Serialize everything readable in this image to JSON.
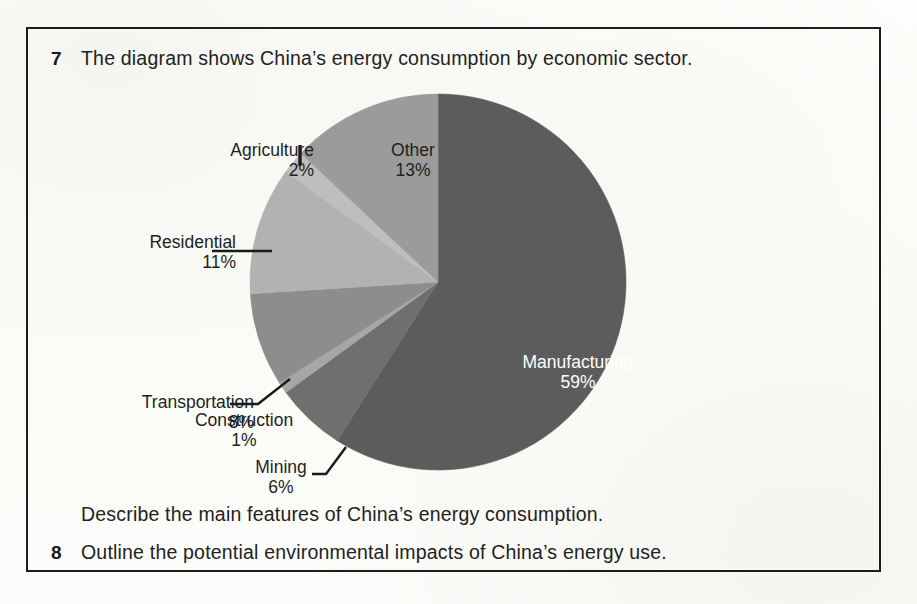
{
  "exercise": {
    "question_7": {
      "number": "7",
      "prompt": "The diagram shows China’s energy consumption by economic sector.",
      "sub_prompt": "Describe the main features of China’s energy consumption."
    },
    "question_8": {
      "number": "8",
      "prompt": "Outline the potential environmental impacts of China’s energy use."
    }
  },
  "chart_data": {
    "type": "pie",
    "title": "China’s energy consumption by economic sector",
    "xlabel": "",
    "ylabel": "",
    "legend_position": "none",
    "labels_outside": true,
    "categories": [
      "Manufacturing",
      "Other",
      "Agriculture",
      "Residential",
      "Transportation",
      "Construction",
      "Mining"
    ],
    "values": [
      59,
      13,
      2,
      11,
      8,
      1,
      6
    ],
    "value_labels": [
      "59%",
      "13%",
      "2%",
      "11%",
      "8%",
      "1%",
      "6%"
    ],
    "colors": [
      "#5c5c5c",
      "#9b9b9b",
      "#bebebe",
      "#b2b2b2",
      "#8d8d8d",
      "#a6a6a6",
      "#6f6f6f"
    ],
    "slices": [
      {
        "name": "Manufacturing",
        "percent": 59,
        "percent_label": "59%",
        "color": "#5c5c5c",
        "label_placement": "inside",
        "text_color": "#ffffff"
      },
      {
        "name": "Other",
        "percent": 13,
        "percent_label": "13%",
        "color": "#9b9b9b",
        "label_placement": "inside",
        "text_color": "#1f1f1f"
      },
      {
        "name": "Agriculture",
        "percent": 2,
        "percent_label": "2%",
        "color": "#bebebe",
        "label_placement": "outside",
        "text_color": "#1f1f1f"
      },
      {
        "name": "Residential",
        "percent": 11,
        "percent_label": "11%",
        "color": "#b2b2b2",
        "label_placement": "outside",
        "text_color": "#1f1f1f"
      },
      {
        "name": "Transportation",
        "percent": 8,
        "percent_label": "8%",
        "color": "#8d8d8d",
        "label_placement": "outside",
        "text_color": "#1f1f1f"
      },
      {
        "name": "Construction",
        "percent": 1,
        "percent_label": "1%",
        "color": "#a6a6a6",
        "label_placement": "outside",
        "text_color": "#1f1f1f"
      },
      {
        "name": "Mining",
        "percent": 6,
        "percent_label": "6%",
        "color": "#6f6f6f",
        "label_placement": "outside",
        "text_color": "#1f1f1f"
      }
    ]
  },
  "style": {
    "border_color": "#1d1d1d",
    "page_background": "#fdfdfb",
    "text_color": "#222222"
  }
}
